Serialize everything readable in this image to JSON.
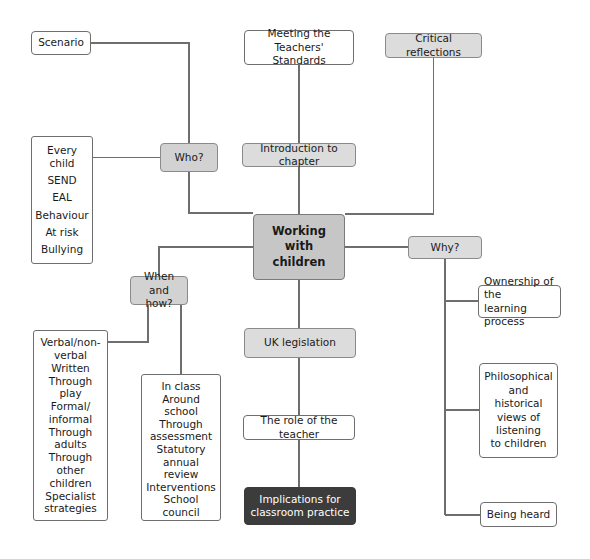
{
  "diagram": {
    "title": "Working with children",
    "colors": {
      "hub_fill": "#c6c6c6",
      "shaded_fill": "#d2d2d2",
      "light_fill": "#dcdcdc",
      "dark_fill": "#3c3c3c",
      "plain_fill": "#ffffff",
      "stroke": "#6e6e6e",
      "text": "#1a1a1a",
      "text_inverse": "#ffffff"
    },
    "nodes": {
      "scenario": {
        "label": "Scenario"
      },
      "who": {
        "label": "Who?"
      },
      "who_list": {
        "items": [
          "Every child",
          "SEND",
          "EAL",
          "Behaviour",
          "At risk",
          "Bullying"
        ]
      },
      "meeting_standards": {
        "line1": "Meeting the Teachers'",
        "line2": "Standards"
      },
      "critical_reflections": {
        "label": "Critical reflections"
      },
      "introduction": {
        "label": "Introduction to chapter"
      },
      "hub": {
        "line1": "Working with",
        "line2": "children"
      },
      "why": {
        "label": "Why?"
      },
      "when_and_how": {
        "line1": "When and",
        "line2": "how?"
      },
      "uk_legislation": {
        "label": "UK legislation"
      },
      "role_of_teacher": {
        "label": "The role of the teacher"
      },
      "implications": {
        "line1": "Implications for",
        "line2": "classroom practice"
      },
      "ownership": {
        "line1": "Ownership of the",
        "line2": "learning process"
      },
      "philosophical": {
        "lines": [
          "Philosophical",
          "and",
          "historical",
          "views of",
          "listening",
          "to children"
        ]
      },
      "being_heard": {
        "label": "Being heard"
      },
      "how_list": {
        "items": [
          "Verbal/non-",
          "verbal",
          "Written",
          "Through play",
          "Formal/",
          "informal",
          "Through adults",
          "Through other",
          "children",
          "Specialist",
          "strategies"
        ],
        "entries": [
          {
            "line1": "Verbal/non-",
            "line2": "verbal"
          },
          {
            "line1": "Written",
            "line2": ""
          },
          {
            "line1": "Through play",
            "line2": ""
          },
          {
            "line1": "Formal/",
            "line2": "informal"
          },
          {
            "line1": "Through adults",
            "line2": ""
          },
          {
            "line1": "Through other",
            "line2": "children"
          },
          {
            "line1": "Specialist",
            "line2": "strategies"
          }
        ]
      },
      "where_list": {
        "entries": [
          {
            "line1": "In class",
            "line2": ""
          },
          {
            "line1": "Around school",
            "line2": ""
          },
          {
            "line1": "Through",
            "line2": "assessment"
          },
          {
            "line1": "Statutory annual",
            "line2": "review"
          },
          {
            "line1": "Interventions",
            "line2": ""
          },
          {
            "line1": "School council",
            "line2": ""
          }
        ]
      }
    }
  }
}
